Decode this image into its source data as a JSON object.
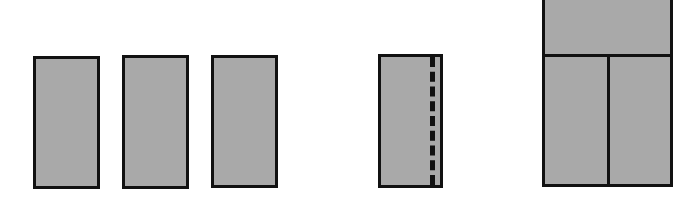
{
  "diagram": {
    "title": "",
    "colors": {
      "fill": "#a9a9a9",
      "stroke": "#111111",
      "background": "#ffffff"
    },
    "shapes": [
      {
        "id": "rect-1",
        "type": "rectangle",
        "x": 33,
        "y": 56,
        "w": 67,
        "h": 133
      },
      {
        "id": "rect-2",
        "type": "rectangle",
        "x": 122,
        "y": 55,
        "w": 67,
        "h": 134
      },
      {
        "id": "rect-3",
        "type": "rectangle",
        "x": 211,
        "y": 55,
        "w": 67,
        "h": 133
      },
      {
        "id": "rect-4-dashed-fold",
        "type": "rectangle",
        "x": 378,
        "y": 54,
        "w": 65,
        "h": 134,
        "dashed_line_x": 432
      },
      {
        "id": "rect-5-divided",
        "type": "rectangle",
        "x": 542,
        "y": -3,
        "w": 131,
        "h": 190,
        "h_divider_y": 52,
        "v_divider_x": 606
      }
    ]
  }
}
